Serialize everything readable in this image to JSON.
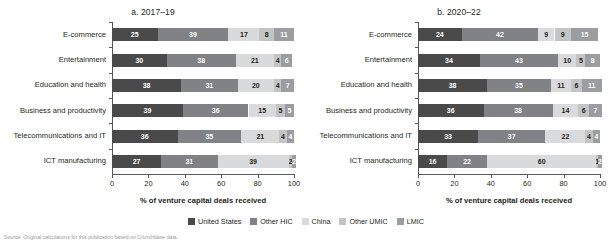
{
  "legend": {
    "items": [
      {
        "label": "United States",
        "color": "#4a4a4a"
      },
      {
        "label": "Other HIC",
        "color": "#808285"
      },
      {
        "label": "China",
        "color": "#d9dadb"
      },
      {
        "label": "Other UMIC",
        "color": "#c2c4c6"
      },
      {
        "label": "LMIC",
        "color": "#9b9da0"
      }
    ]
  },
  "source": {
    "text": "Source: Original calculations for this publication based on Crunchbase data."
  },
  "chart_data": [
    {
      "type": "bar",
      "orientation": "horizontal",
      "stacked": true,
      "title": "a. 2017–19",
      "xlabel": "% of venture capital deals received",
      "ylabel": "",
      "xlim": [
        0,
        100
      ],
      "xticks": [
        0,
        20,
        40,
        60,
        80,
        100
      ],
      "grid": false,
      "legend_position": "bottom",
      "categories": [
        "E-commerce",
        "Entertainment",
        "Education and health",
        "Business and productivity",
        "Telecommunications and IT",
        "ICT manufacturing"
      ],
      "series": [
        {
          "name": "United States",
          "color": "#4a4a4a",
          "values": [
            25,
            30,
            38,
            39,
            36,
            27
          ]
        },
        {
          "name": "Other HIC",
          "color": "#808285",
          "values": [
            39,
            38,
            31,
            36,
            35,
            31
          ]
        },
        {
          "name": "China",
          "color": "#d9dadb",
          "values": [
            17,
            21,
            20,
            15,
            21,
            39
          ]
        },
        {
          "name": "Other UMIC",
          "color": "#c2c4c6",
          "values": [
            8,
            4,
            4,
            5,
            4,
            2
          ]
        },
        {
          "name": "LMIC",
          "color": "#9b9da0",
          "values": [
            11,
            6,
            7,
            5,
            4,
            2
          ]
        }
      ]
    },
    {
      "type": "bar",
      "orientation": "horizontal",
      "stacked": true,
      "title": "b. 2020–22",
      "xlabel": "% of venture capital deals received",
      "ylabel": "",
      "xlim": [
        0,
        100
      ],
      "xticks": [
        0,
        20,
        40,
        60,
        80,
        100
      ],
      "grid": false,
      "legend_position": "bottom",
      "categories": [
        "E-commerce",
        "Entertainment",
        "Education and health",
        "Business and productivity",
        "Telecommunications and IT",
        "ICT manufacturing"
      ],
      "series": [
        {
          "name": "United States",
          "color": "#4a4a4a",
          "values": [
            24,
            34,
            38,
            36,
            33,
            16
          ]
        },
        {
          "name": "Other HIC",
          "color": "#808285",
          "values": [
            42,
            43,
            35,
            38,
            37,
            22
          ]
        },
        {
          "name": "China",
          "color": "#d9dadb",
          "values": [
            9,
            10,
            11,
            14,
            22,
            60
          ]
        },
        {
          "name": "Other UMIC",
          "color": "#c2c4c6",
          "values": [
            9,
            5,
            6,
            6,
            4,
            1
          ]
        },
        {
          "name": "LMIC",
          "color": "#9b9da0",
          "values": [
            15,
            8,
            11,
            7,
            4,
            2
          ]
        }
      ]
    }
  ]
}
